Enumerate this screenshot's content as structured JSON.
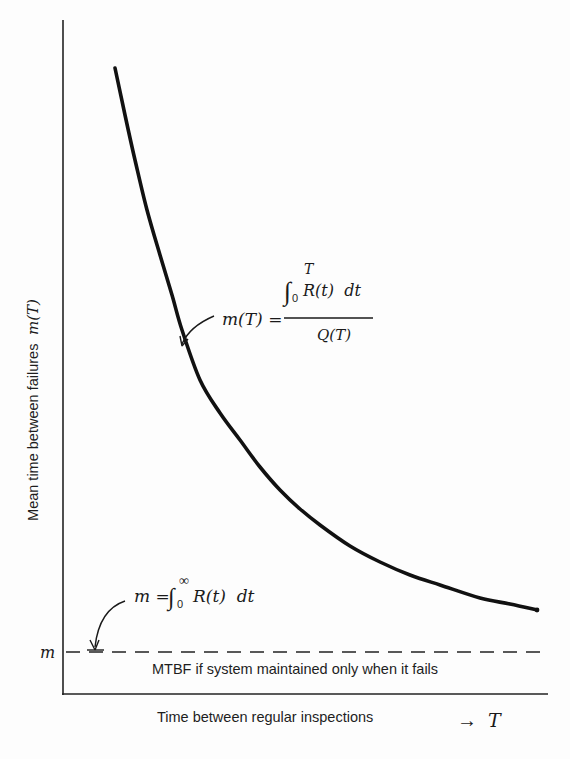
{
  "chart_data": {
    "type": "line",
    "title": "",
    "xlabel": "Time between regular inspections",
    "x_symbol": "T",
    "x_arrow": "→",
    "ylabel_text": "Mean time between failures",
    "ylabel_symbol": "m(T)",
    "y_tick_label": "m",
    "grid": false,
    "legend": null,
    "series": [
      {
        "name": "m(T)",
        "style": "solid-thick",
        "description": "Decreasing convex curve approaching asymptote m as T increases",
        "points_px": [
          [
            115,
            68
          ],
          [
            125,
            115
          ],
          [
            135,
            160
          ],
          [
            147,
            210
          ],
          [
            160,
            255
          ],
          [
            172,
            295
          ],
          [
            182,
            330
          ],
          [
            200,
            380
          ],
          [
            220,
            413
          ],
          [
            240,
            440
          ],
          [
            260,
            467
          ],
          [
            280,
            490
          ],
          [
            300,
            509
          ],
          [
            320,
            525
          ],
          [
            350,
            546
          ],
          [
            380,
            562
          ],
          [
            410,
            575
          ],
          [
            440,
            585
          ],
          [
            480,
            598
          ],
          [
            510,
            604
          ],
          [
            537,
            610
          ]
        ]
      },
      {
        "name": "MTBF asymptote",
        "style": "dashed",
        "y_px": 652,
        "x_range_px": [
          70,
          540
        ]
      }
    ],
    "annotations": [
      {
        "id": "mT_formula",
        "lhs": "m(T) =",
        "numerator_integral": "∫",
        "lower_limit": "0",
        "upper_limit": "T",
        "integrand": "R(t)  dt",
        "denominator": "Q(T)"
      },
      {
        "id": "m_formula",
        "lhs": "m =",
        "integral": "∫",
        "lower_limit": "0",
        "upper_limit": "∞",
        "integrand": "R(t)  dt"
      },
      {
        "id": "mtbf_note",
        "text": "MTBF if system maintained only when it fails"
      }
    ],
    "axes": {
      "x_origin_px": 63,
      "y_origin_px": 694,
      "x_end_px": 548,
      "y_top_px": 20
    }
  }
}
